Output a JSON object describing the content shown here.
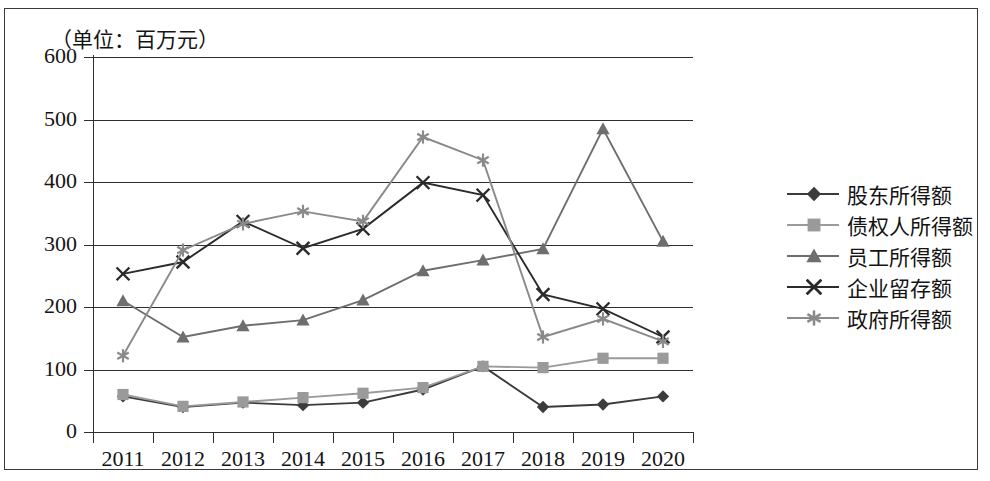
{
  "unit_note": "（单位：百万元）",
  "axis": {
    "y_ticks": [
      "600",
      "500",
      "400",
      "300",
      "200",
      "100",
      "0"
    ],
    "x_ticks": [
      "2011",
      "2012",
      "2013",
      "2014",
      "2015",
      "2016",
      "2017",
      "2018",
      "2019",
      "2020"
    ]
  },
  "legend": {
    "items": [
      {
        "label": "股东所得额",
        "marker": "diamond-marker",
        "color": "#3b3b3b"
      },
      {
        "label": "债权人所得额",
        "marker": "square-marker",
        "color": "#9a9a9a"
      },
      {
        "label": "员工所得额",
        "marker": "triangle-marker",
        "color": "#6e6e6e"
      },
      {
        "label": "企业留存额",
        "marker": "cross-marker",
        "color": "#2b2b2b"
      },
      {
        "label": "政府所得额",
        "marker": "asterisk-marker",
        "color": "#8a8a8a"
      }
    ]
  },
  "chart_data": {
    "type": "line",
    "title": "",
    "subtitle": "",
    "xlabel": "",
    "ylabel": "",
    "unit": "百万元",
    "grid": true,
    "legend_position": "right",
    "categories": [
      "2011",
      "2012",
      "2013",
      "2014",
      "2015",
      "2016",
      "2017",
      "2018",
      "2019",
      "2020"
    ],
    "ylim": [
      0,
      600
    ],
    "ytick_step": 100,
    "series": [
      {
        "name": "股东所得额",
        "marker": "diamond",
        "color": "#3b3b3b",
        "values": [
          57,
          40,
          47,
          43,
          47,
          68,
          105,
          40,
          44,
          57
        ]
      },
      {
        "name": "债权人所得额",
        "marker": "square",
        "color": "#9a9a9a",
        "values": [
          60,
          41,
          48,
          55,
          62,
          71,
          105,
          103,
          118,
          118
        ]
      },
      {
        "name": "员工所得额",
        "marker": "triangle",
        "color": "#6e6e6e",
        "values": [
          210,
          152,
          170,
          179,
          211,
          258,
          275,
          293,
          485,
          305
        ]
      },
      {
        "name": "企业留存额",
        "marker": "cross",
        "color": "#2b2b2b",
        "values": [
          253,
          272,
          337,
          294,
          325,
          399,
          379,
          220,
          197,
          152
        ]
      },
      {
        "name": "政府所得额",
        "marker": "asterisk",
        "color": "#8a8a8a",
        "values": [
          122,
          291,
          333,
          353,
          337,
          472,
          435,
          152,
          181,
          145
        ]
      }
    ]
  }
}
